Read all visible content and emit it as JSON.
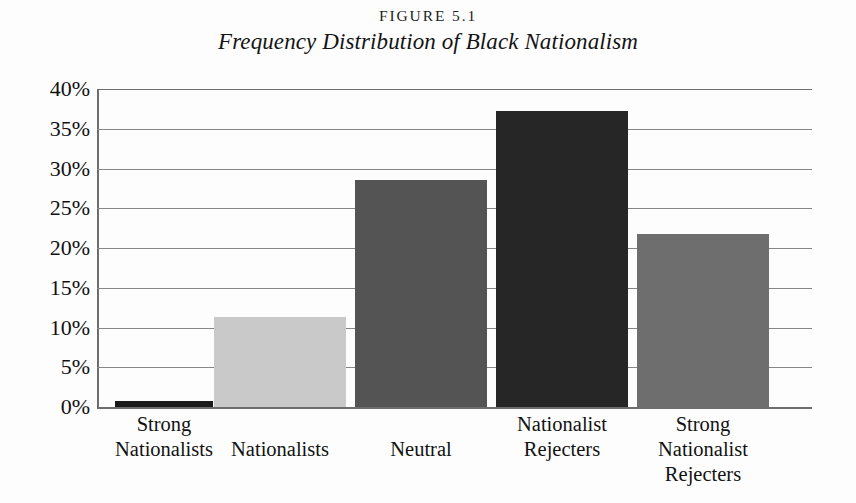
{
  "figure": {
    "number": "FIGURE 5.1",
    "title": "Frequency Distribution of Black Nationalism"
  },
  "chart_data": {
    "type": "bar",
    "title": "Frequency Distribution of Black Nationalism",
    "subtitle": "FIGURE 5.1",
    "xlabel": "",
    "ylabel": "",
    "ylim": [
      0,
      40
    ],
    "grid": true,
    "legend": "none",
    "categories": [
      "Strong Nationalists",
      "Nationalists",
      "Neutral",
      "Nationalist Rejecters",
      "Strong Nationalist Rejecters"
    ],
    "category_lines": [
      [
        "Strong",
        "Nationalists"
      ],
      [
        "Nationalists"
      ],
      [
        "Neutral"
      ],
      [
        "Nationalist",
        "Rejecters"
      ],
      [
        "Strong",
        "Nationalist",
        "Rejecters"
      ]
    ],
    "values": [
      0.7,
      11.3,
      28.5,
      37.2,
      21.8
    ],
    "value_unit": "%",
    "ytick_labels": [
      "40%",
      "35%",
      "30%",
      "25%",
      "20%",
      "15%",
      "10%",
      "5%",
      "0%"
    ],
    "ytick_values": [
      40,
      35,
      30,
      25,
      20,
      15,
      10,
      5,
      0
    ],
    "bar_colors": [
      "#1a1a1a",
      "#c9c9c9",
      "#545454",
      "#262626",
      "#6e6e6e"
    ]
  },
  "colors": {
    "background": "#fdfdfd",
    "axis": "#6d6d6d",
    "gridline": "#868686",
    "text": "#121212"
  }
}
